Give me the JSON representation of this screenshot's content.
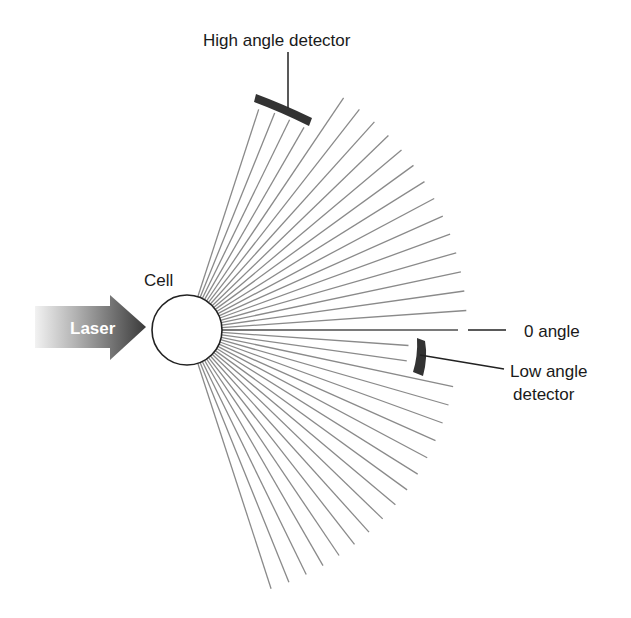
{
  "labels": {
    "high_angle_detector": "High angle detector",
    "cell": "Cell",
    "laser": "Laser",
    "zero_angle": "0 angle",
    "low_angle_detector_line1": "Low angle",
    "low_angle_detector_line2": "detector"
  },
  "colors": {
    "ray": "#8a8a8a",
    "detector": "#333333",
    "text": "#1a1a1a",
    "arrow_dark": "#3a3a3a",
    "arrow_light": "#e6e6e6",
    "cell_stroke": "#222222"
  },
  "geometry": {
    "cell_center": [
      187,
      330
    ],
    "cell_radius": 35,
    "ray_angles_deg": [
      72,
      68,
      64,
      60,
      56,
      52,
      48,
      44,
      40,
      36,
      32,
      28,
      24,
      20,
      16,
      12,
      8,
      4,
      0,
      -4,
      -8,
      -12,
      -16,
      -20,
      -24,
      -28,
      -32,
      -36,
      -40,
      -44,
      -48,
      -52,
      -56,
      -60,
      -64,
      -68,
      -72
    ],
    "ray_lengths": {
      "72": 232,
      "68": 234,
      "64": 234,
      "60": 234,
      "0": 271,
      "-4": 222,
      "-8": 222
    },
    "default_ray_length_upper": 280,
    "default_ray_length_lower": 272
  }
}
